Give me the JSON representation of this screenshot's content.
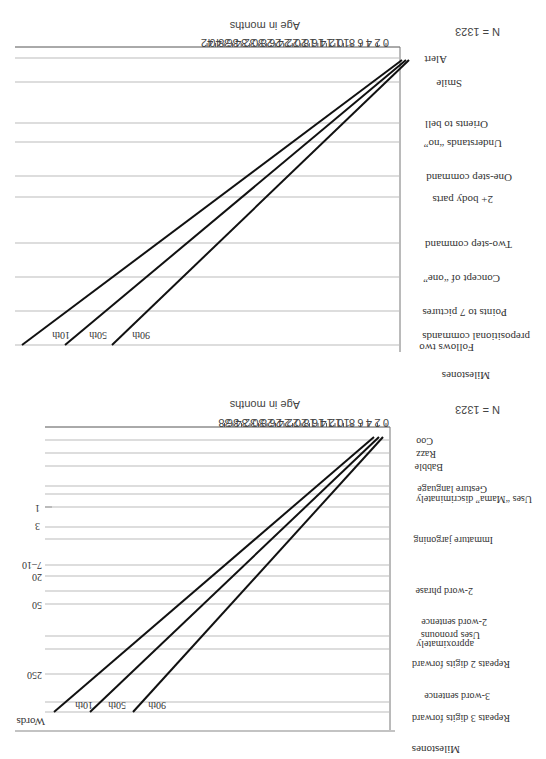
{
  "orientation": "rotated 180 degrees",
  "chart_data": [
    {
      "type": "line",
      "title": "Receptive language milestones",
      "n_label": "N = 1323",
      "xlabel": "Age in months",
      "ylabel": "Milestones",
      "x_ticks": [
        0,
        2,
        4,
        6,
        8,
        10,
        12,
        14,
        16,
        18,
        20,
        22,
        24,
        26,
        28,
        30,
        32,
        34,
        36,
        38,
        40,
        42
      ],
      "xlim": [
        0,
        42
      ],
      "milestones": [
        "Alert",
        "Smile",
        "Orients to bell",
        "Understands “no”",
        "One-step command",
        "2+ body parts",
        "Two-step command",
        "Concept of “one”",
        "Points to 7 pictures",
        "Follows two prepositional commands"
      ],
      "series": [
        {
          "name": "90th",
          "values": [
            0.5,
            1.5,
            5,
            7,
            9.5,
            11,
            14.5,
            18,
            21.5,
            32
          ]
        },
        {
          "name": "50th",
          "values": [
            0.3,
            1.8,
            6,
            8.5,
            11.5,
            13.5,
            18,
            22.5,
            27,
            38.5
          ]
        },
        {
          "name": "10th",
          "values": [
            0.2,
            2,
            7,
            10,
            13.5,
            16,
            21,
            26,
            31,
            43
          ]
        }
      ],
      "line_labels": [
        "90th",
        "50th",
        "10th"
      ]
    },
    {
      "type": "line",
      "title": "Expressive language milestones",
      "n_label": "N = 1323",
      "xlabel": "Age in months",
      "ylabel": "Milestones",
      "y2label": "Words",
      "x_ticks": [
        0,
        2,
        4,
        6,
        8,
        10,
        12,
        14,
        16,
        18,
        20,
        22,
        24,
        26,
        28,
        30,
        32,
        34,
        36,
        38
      ],
      "xlim": [
        0,
        38
      ],
      "milestones": [
        "Coo",
        "Razz",
        "Babble",
        "Gesture language",
        "Uses “Mama” discriminately",
        "Immature jargoning",
        "2-word phrase",
        "2-word sentence",
        "Uses pronouns approximately",
        "Repeats 2 digits forward",
        "3-word sentence",
        "Repeats 3 digits forward"
      ],
      "word_counts": [
        {
          "label": "1",
          "row": "Uses “Mama” discriminately"
        },
        {
          "label": "3"
        },
        {
          "label": "7–10"
        },
        {
          "label": "20"
        },
        {
          "label": "50"
        },
        {
          "label": "250"
        }
      ],
      "series": [
        {
          "name": "90th"
        },
        {
          "name": "50th"
        },
        {
          "name": "10th"
        }
      ],
      "line_labels": [
        "90th",
        "50th",
        "10th"
      ]
    }
  ],
  "top": {
    "n": "N = 1323",
    "xlabel": "Age in months",
    "ylabel": "Milestones",
    "ticks": [
      "0",
      "2",
      "4",
      "6",
      "8",
      "10",
      "12",
      "14",
      "16",
      "18",
      "20",
      "22",
      "24",
      "26",
      "28",
      "30",
      "32",
      "34",
      "36",
      "38",
      "40",
      "42"
    ],
    "rows": [
      "Alert",
      "Smile",
      "Orients to bell",
      "Understands “no”",
      "One-step command",
      "2+ body parts",
      "Two-step command",
      "Concept of “one”",
      "Points to 7 pictures",
      "Follows two",
      "prepositional commands"
    ],
    "lines": [
      "90th",
      "50th",
      "10th"
    ]
  },
  "bottom": {
    "n": "N = 1323",
    "xlabel": "Age in months",
    "ylabel": "Milestones",
    "words": "Words",
    "ticks": [
      "0",
      "2",
      "4",
      "6",
      "8",
      "10",
      "12",
      "14",
      "16",
      "18",
      "20",
      "22",
      "24",
      "26",
      "28",
      "30",
      "32",
      "34",
      "36",
      "38"
    ],
    "rows": [
      "Coo",
      "Razz",
      "Babble",
      "Gesture language",
      "Uses “Mama” discriminately",
      "Immature jargoning",
      "2-word phrase",
      "2-word sentence",
      "Uses pronouns",
      "approximately",
      "Repeats 2 digits forward",
      "3-word sentence",
      "Repeats 3 digits forward"
    ],
    "word_counts": [
      "1",
      "3",
      "7–10",
      "20",
      "50",
      "250"
    ],
    "lines": [
      "90th",
      "50th",
      "10th"
    ]
  }
}
